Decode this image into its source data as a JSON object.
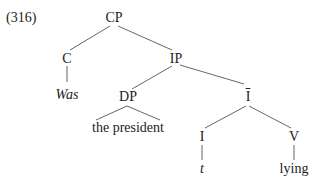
{
  "example_number": "(316)",
  "nodes": {
    "cp": "CP",
    "c": "C",
    "was": "Was",
    "ip": "IP",
    "dp": "DP",
    "the_president": "the president",
    "ibar": "I",
    "i": "I",
    "t": "t",
    "v": "V",
    "lying": "lying"
  }
}
